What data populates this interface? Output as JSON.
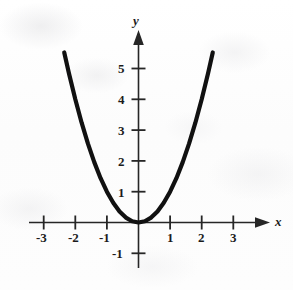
{
  "figure": {
    "background_color": "#fdfdfd",
    "ink_color": "#1b1b1b",
    "curve_color": "#111111"
  },
  "chart_data": {
    "type": "line",
    "title": "",
    "subtitle": "",
    "xlabel": "x",
    "ylabel": "y",
    "function_label": "y = x^2",
    "grid": false,
    "legend": false,
    "xlim": [
      -3.6,
      3.6
    ],
    "ylim": [
      -1.8,
      6.0
    ],
    "x_ticks": [
      -3,
      -2,
      -1,
      1,
      2,
      3
    ],
    "y_ticks": [
      5,
      4,
      3,
      2,
      1,
      -1
    ],
    "x_tick_labels": [
      "-3",
      "-2",
      "-1",
      "1",
      "2",
      "3"
    ],
    "y_tick_labels": [
      "5",
      "4",
      "3",
      "2",
      "1",
      "-1"
    ],
    "x_axis_arrow": true,
    "y_axis_arrow": true,
    "series": [
      {
        "name": "y = x^2",
        "x": [
          -2.35,
          -2.2,
          -2.0,
          -1.8,
          -1.6,
          -1.4,
          -1.2,
          -1.0,
          -0.8,
          -0.6,
          -0.4,
          -0.2,
          0.0,
          0.2,
          0.4,
          0.6,
          0.8,
          1.0,
          1.2,
          1.4,
          1.6,
          1.8,
          2.0,
          2.2,
          2.35
        ],
        "y": [
          5.52,
          4.84,
          4.0,
          3.24,
          2.56,
          1.96,
          1.44,
          1.0,
          0.64,
          0.36,
          0.16,
          0.04,
          0.0,
          0.04,
          0.16,
          0.36,
          0.64,
          1.0,
          1.44,
          1.96,
          2.56,
          3.24,
          4.0,
          4.84,
          5.52
        ]
      }
    ],
    "annotations": []
  },
  "axis_labels": {
    "x_name": "x",
    "y_name": "y"
  }
}
